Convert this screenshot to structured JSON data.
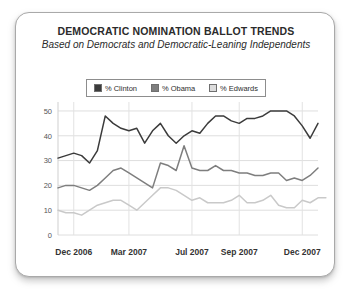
{
  "chart_data": {
    "type": "line",
    "title": "DEMOCRATIC NOMINATION BALLOT TRENDS",
    "subtitle": "Based on Democrats and Democratic-Leaning Independents",
    "xlabel": "",
    "ylabel": "",
    "ylim": [
      0,
      52
    ],
    "yticks": [
      0,
      10,
      20,
      30,
      40,
      50
    ],
    "ytick_labels": [
      "0",
      "10",
      "20",
      "30",
      "40",
      "50"
    ],
    "xtick_labels": [
      "Dec 2006",
      "Mar 2007",
      "Jul 2007",
      "Sep 2007",
      "Dec 2007"
    ],
    "xtick_positions": [
      2,
      9,
      17,
      23,
      31
    ],
    "grid": true,
    "legend_position": "top-center",
    "x_count": 34,
    "series": [
      {
        "name": "% Clinton",
        "color": "#3b3b3b",
        "values": [
          31,
          32,
          33,
          32,
          29,
          34,
          48,
          45,
          43,
          42,
          43,
          37,
          42,
          45,
          40,
          37,
          40,
          42,
          41,
          45,
          48,
          48,
          46,
          45,
          47,
          47,
          48,
          50,
          50,
          50,
          48,
          44,
          39,
          45
        ]
      },
      {
        "name": "% Obama",
        "color": "#7e7e7e",
        "values": [
          19,
          20,
          20,
          19,
          18,
          20,
          23,
          26,
          27,
          25,
          23,
          21,
          19,
          29,
          28,
          26,
          36,
          27,
          26,
          26,
          28,
          26,
          26,
          25,
          25,
          24,
          24,
          25,
          25,
          22,
          23,
          22,
          24,
          27
        ]
      },
      {
        "name": "% Edwards",
        "color": "#c9c9c9",
        "values": [
          10,
          9,
          9,
          8,
          10,
          12,
          13,
          14,
          14,
          12,
          10,
          13,
          16,
          19,
          19,
          18,
          16,
          14,
          15,
          13,
          13,
          13,
          14,
          16,
          13,
          13,
          14,
          16,
          12,
          11,
          11,
          14,
          13,
          15,
          15
        ]
      }
    ]
  },
  "legend": {
    "items": [
      {
        "label": "% Clinton",
        "color": "#3b3b3b"
      },
      {
        "label": "% Obama",
        "color": "#7e7e7e"
      },
      {
        "label": "% Edwards",
        "color": "#dcdcdc"
      }
    ]
  }
}
